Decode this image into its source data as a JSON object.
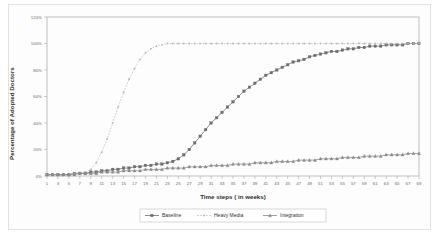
{
  "chart_data": {
    "type": "line",
    "title": "",
    "xlabel": "Time steps ( in weeks)",
    "ylabel": "Percentage of Adopted Doctors",
    "xlim": [
      1,
      69
    ],
    "ylim": [
      0,
      120
    ],
    "ytick_labels": [
      "0%",
      "20%",
      "40%",
      "60%",
      "80%",
      "100%",
      "120%"
    ],
    "ytick_values": [
      0,
      20,
      40,
      60,
      80,
      100,
      120
    ],
    "xtick_labels": [
      "1",
      "3",
      "5",
      "7",
      "9",
      "11",
      "13",
      "15",
      "17",
      "19",
      "21",
      "23",
      "25",
      "27",
      "29",
      "31",
      "33",
      "35",
      "37",
      "39",
      "41",
      "43",
      "45",
      "47",
      "49",
      "51",
      "53",
      "55",
      "57",
      "59",
      "61",
      "63",
      "65",
      "67",
      "69"
    ],
    "grid": false,
    "legend_position": "bottom",
    "x": [
      1,
      2,
      3,
      4,
      5,
      6,
      7,
      8,
      9,
      10,
      11,
      12,
      13,
      14,
      15,
      16,
      17,
      18,
      19,
      20,
      21,
      22,
      23,
      24,
      25,
      26,
      27,
      28,
      29,
      30,
      31,
      32,
      33,
      34,
      35,
      36,
      37,
      38,
      39,
      40,
      41,
      42,
      43,
      44,
      45,
      46,
      47,
      48,
      49,
      50,
      51,
      52,
      53,
      54,
      55,
      56,
      57,
      58,
      59,
      60,
      61,
      62,
      63,
      64,
      65,
      66,
      67,
      68,
      69
    ],
    "series": [
      {
        "name": "Baseline",
        "color": "#6d6d6d",
        "marker": "square",
        "values": [
          1,
          1,
          1,
          1,
          1,
          2,
          2,
          2,
          3,
          3,
          4,
          4,
          5,
          5,
          6,
          6,
          7,
          7,
          8,
          8,
          9,
          9,
          10,
          11,
          13,
          16,
          20,
          25,
          30,
          35,
          40,
          44,
          48,
          52,
          56,
          60,
          64,
          67,
          70,
          73,
          76,
          78,
          80,
          82,
          84,
          86,
          87,
          88,
          90,
          91,
          92,
          93,
          94,
          94,
          95,
          96,
          96,
          97,
          97,
          98,
          98,
          98,
          99,
          99,
          99,
          99,
          100,
          100,
          100
        ]
      },
      {
        "name": "Heavy Media",
        "color": "#b9b9b9",
        "marker": "dot",
        "values": [
          1,
          1,
          1,
          1,
          1,
          2,
          2,
          3,
          5,
          10,
          18,
          28,
          40,
          52,
          63,
          73,
          81,
          88,
          93,
          96,
          98,
          99,
          100,
          100,
          100,
          100,
          100,
          100,
          100,
          100,
          100,
          100,
          100,
          100,
          100,
          100,
          100,
          100,
          100,
          100,
          100,
          100,
          100,
          100,
          100,
          100,
          100,
          100,
          100,
          100,
          100,
          100,
          100,
          100,
          100,
          100,
          100,
          100,
          100,
          100,
          100,
          100,
          100,
          100,
          100,
          100,
          100,
          100,
          100
        ]
      },
      {
        "name": "Integration",
        "color": "#8a8a8a",
        "marker": "triangle",
        "values": [
          1,
          1,
          1,
          1,
          1,
          1,
          2,
          2,
          2,
          2,
          3,
          3,
          3,
          3,
          4,
          4,
          4,
          4,
          5,
          5,
          5,
          5,
          6,
          6,
          6,
          6,
          7,
          7,
          7,
          7,
          8,
          8,
          8,
          8,
          9,
          9,
          9,
          9,
          10,
          10,
          10,
          10,
          11,
          11,
          11,
          11,
          12,
          12,
          12,
          12,
          13,
          13,
          13,
          13,
          14,
          14,
          14,
          14,
          15,
          15,
          15,
          15,
          16,
          16,
          16,
          16,
          17,
          17,
          17
        ]
      }
    ]
  },
  "legend": {
    "items": [
      {
        "label": "Baseline"
      },
      {
        "label": "Heavy Media"
      },
      {
        "label": "Integration"
      }
    ]
  }
}
